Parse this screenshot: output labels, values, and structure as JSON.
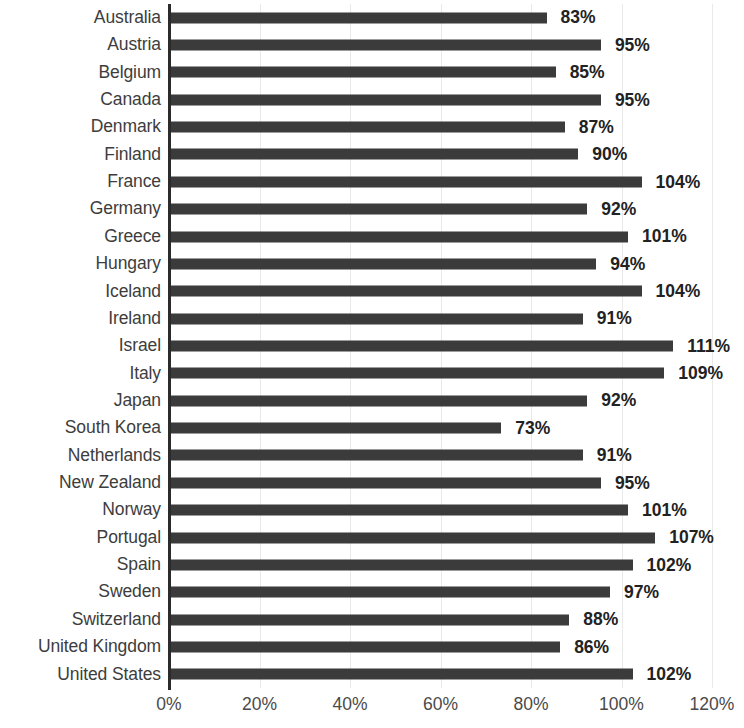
{
  "chart_data": {
    "type": "bar",
    "orientation": "horizontal",
    "title": "",
    "subtitle": "",
    "xlabel": "",
    "ylabel": "",
    "xlim": [
      0,
      120
    ],
    "xtick_labels": [
      "0%",
      "20%",
      "40%",
      "60%",
      "80%",
      "100%",
      "120%"
    ],
    "xticks": [
      0,
      20,
      40,
      60,
      80,
      100,
      120
    ],
    "grid": true,
    "legend": null,
    "value_suffix": "%",
    "bar_color": "#3b3b3b",
    "gridline_color": "#e9e9e9",
    "axis_color": "#2b2b2b",
    "label_color": "#3d3d3d",
    "value_label_color": "#222222",
    "categories": [
      "Australia",
      "Austria",
      "Belgium",
      "Canada",
      "Denmark",
      "Finland",
      "France",
      "Germany",
      "Greece",
      "Hungary",
      "Iceland",
      "Ireland",
      "Israel",
      "Italy",
      "Japan",
      "South Korea",
      "Netherlands",
      "New Zealand",
      "Norway",
      "Portugal",
      "Spain",
      "Sweden",
      "Switzerland",
      "United Kingdom",
      "United States"
    ],
    "values": [
      83,
      95,
      85,
      95,
      87,
      90,
      104,
      92,
      101,
      94,
      104,
      91,
      111,
      109,
      92,
      73,
      91,
      95,
      101,
      107,
      102,
      97,
      88,
      86,
      102
    ],
    "value_labels": [
      "83%",
      "95%",
      "85%",
      "95%",
      "87%",
      "90%",
      "104%",
      "92%",
      "101%",
      "94%",
      "104%",
      "91%",
      "111%",
      "109%",
      "92%",
      "73%",
      "91%",
      "95%",
      "101%",
      "107%",
      "102%",
      "97%",
      "88%",
      "86%",
      "102%"
    ]
  }
}
